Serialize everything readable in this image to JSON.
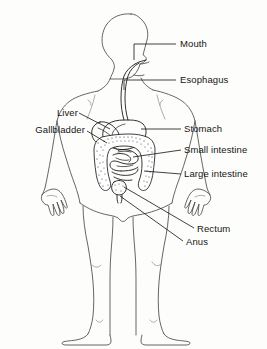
{
  "diagram": {
    "line_color": "#1a1a1a",
    "outline_color": "#4a4a4a",
    "background_color": "#fdfdfb",
    "text_color": "#151515"
  },
  "labels": {
    "mouth": "Mouth",
    "esophagus": "Esophagus",
    "liver": "Liver",
    "gallbladder": "Gallbladder",
    "stomach": "Stomach",
    "small_intestine": "Small intestine",
    "large_intestine": "Large intestine",
    "rectum": "Rectum",
    "anus": "Anus"
  },
  "annotations": [
    {
      "key": "mouth",
      "text": "Mouth",
      "side": "right",
      "x": 180,
      "y": 38,
      "leader": "M134,44 L176,44"
    },
    {
      "key": "esophagus",
      "text": "Esophagus",
      "side": "right",
      "x": 180,
      "y": 74,
      "leader": "M126,80 L176,80"
    },
    {
      "key": "liver",
      "text": "Liver",
      "side": "left",
      "x": 38,
      "y": 107,
      "leader": "M80,113 L116,126"
    },
    {
      "key": "gallbladder",
      "text": "Gallbladder",
      "side": "left",
      "x": 5,
      "y": 124,
      "leader": "M86,130 L118,133"
    },
    {
      "key": "stomach",
      "text": "Stomach",
      "side": "right",
      "x": 184,
      "y": 123,
      "leader": "M142,129 L180,129"
    },
    {
      "key": "small_intestine",
      "text": "Small intestine",
      "side": "right",
      "x": 184,
      "y": 144,
      "leader": "M136,150 L180,150"
    },
    {
      "key": "large_intestine",
      "text": "Large intestine",
      "side": "right",
      "x": 184,
      "y": 168,
      "leader": "M140,174 L180,174"
    },
    {
      "key": "rectum",
      "text": "Rectum",
      "side": "right",
      "x": 197,
      "y": 223,
      "leader": "M122,186 L194,228"
    },
    {
      "key": "anus",
      "text": "Anus",
      "side": "right",
      "x": 186,
      "y": 236,
      "leader": "M120,190 L183,241"
    }
  ]
}
